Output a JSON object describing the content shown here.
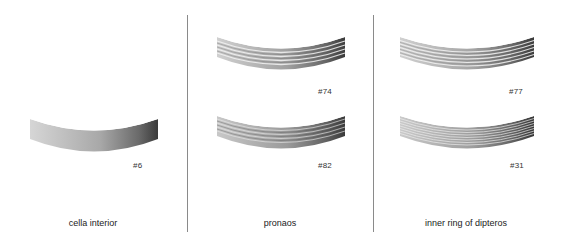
{
  "figure": {
    "panels": [
      {
        "caption": "cella interior",
        "drums": [
          {
            "id": "#6",
            "fluting": "plain",
            "lines": 0
          }
        ]
      },
      {
        "caption": "pronaos",
        "drums": [
          {
            "id": "#74",
            "fluting": "wide-bands",
            "lines": 5
          },
          {
            "id": "#82",
            "fluting": "fine-bands",
            "lines": 5
          }
        ]
      },
      {
        "caption": "inner ring of dipteros",
        "drums": [
          {
            "id": "#77",
            "fluting": "wide-bands",
            "lines": 6
          },
          {
            "id": "#31",
            "fluting": "fine-bands",
            "lines": 8
          }
        ]
      }
    ],
    "colors": {
      "background": "#ffffff",
      "divider": "#8a8a8a",
      "drum_light": "#d4d4d4",
      "drum_dark": "#3a3a3a",
      "text": "#222222"
    }
  }
}
